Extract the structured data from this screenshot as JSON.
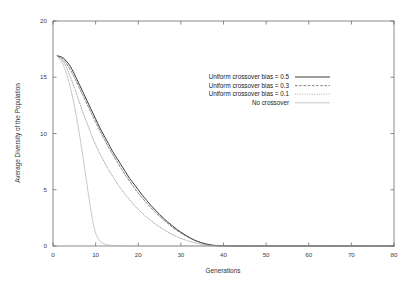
{
  "chart_data": {
    "type": "line",
    "title": "",
    "xlabel": "Generations",
    "ylabel": "Average Diversity of the Population",
    "xlim": [
      0,
      80
    ],
    "ylim": [
      0,
      20
    ],
    "xticks": [
      0,
      10,
      20,
      30,
      40,
      50,
      60,
      70,
      80
    ],
    "yticks": [
      0,
      5,
      10,
      15,
      20
    ],
    "grid": false,
    "legend_position": "upper-center-right",
    "series": [
      {
        "name": "Uniform crossover bias = 0.5",
        "style": "solid",
        "color": "#303030",
        "x": [
          1,
          2,
          3,
          4,
          5,
          6,
          7,
          8,
          9,
          10,
          11,
          12,
          13,
          14,
          15,
          16,
          17,
          18,
          19,
          20,
          21,
          22,
          23,
          24,
          25,
          26,
          27,
          28,
          29,
          30,
          31,
          32,
          33,
          34,
          35,
          36,
          37,
          38,
          40,
          45,
          50,
          60,
          70,
          80
        ],
        "y": [
          16.9,
          16.8,
          16.5,
          16.0,
          15.3,
          14.5,
          13.7,
          12.9,
          12.1,
          11.3,
          10.5,
          9.8,
          9.1,
          8.4,
          7.8,
          7.2,
          6.6,
          6.0,
          5.5,
          5.0,
          4.5,
          4.05,
          3.6,
          3.2,
          2.8,
          2.45,
          2.1,
          1.8,
          1.5,
          1.22,
          0.98,
          0.76,
          0.56,
          0.4,
          0.27,
          0.17,
          0.1,
          0.05,
          0.01,
          0.0,
          0.0,
          0.0,
          0.0,
          0.0
        ]
      },
      {
        "name": "Uniform crossover bias = 0.3",
        "style": "dashed",
        "color": "#5c5c5c",
        "x": [
          1,
          2,
          3,
          4,
          5,
          6,
          7,
          8,
          9,
          10,
          11,
          12,
          13,
          14,
          15,
          16,
          17,
          18,
          19,
          20,
          21,
          22,
          23,
          24,
          25,
          26,
          27,
          28,
          29,
          30,
          31,
          32,
          33,
          34,
          35,
          36,
          37,
          38,
          40,
          45,
          50,
          60,
          70,
          80
        ],
        "y": [
          16.9,
          16.7,
          16.3,
          15.7,
          15.0,
          14.2,
          13.4,
          12.6,
          11.8,
          11.0,
          10.25,
          9.5,
          8.8,
          8.15,
          7.5,
          6.9,
          6.3,
          5.75,
          5.2,
          4.7,
          4.25,
          3.8,
          3.4,
          3.0,
          2.65,
          2.3,
          1.98,
          1.68,
          1.4,
          1.15,
          0.92,
          0.72,
          0.54,
          0.38,
          0.26,
          0.16,
          0.09,
          0.04,
          0.01,
          0.0,
          0.0,
          0.0,
          0.0,
          0.0
        ]
      },
      {
        "name": "Uniform crossover bias = 0.1",
        "style": "dotted",
        "color": "#8a8a8a",
        "x": [
          1,
          2,
          3,
          4,
          5,
          6,
          7,
          8,
          9,
          10,
          11,
          12,
          13,
          14,
          15,
          16,
          17,
          18,
          19,
          20,
          21,
          22,
          23,
          24,
          25,
          26,
          27,
          28,
          29,
          30,
          31,
          32,
          33,
          34,
          35,
          36,
          38,
          40,
          45,
          50,
          60,
          70,
          80
        ],
        "y": [
          16.9,
          16.6,
          16.0,
          15.1,
          14.1,
          13.0,
          11.9,
          10.9,
          9.9,
          9.0,
          8.2,
          7.5,
          6.8,
          6.2,
          5.6,
          5.05,
          4.55,
          4.1,
          3.65,
          3.25,
          2.9,
          2.55,
          2.25,
          1.95,
          1.7,
          1.45,
          1.22,
          1.02,
          0.84,
          0.68,
          0.54,
          0.42,
          0.31,
          0.22,
          0.14,
          0.08,
          0.02,
          0.0,
          0.0,
          0.0,
          0.0,
          0.0,
          0.0
        ]
      },
      {
        "name": "No crossover",
        "style": "solid-light",
        "color": "#b0b0b0",
        "x": [
          1,
          2,
          3,
          4,
          5,
          6,
          7,
          8,
          9,
          9.5,
          10,
          10.5,
          11,
          11.5,
          12,
          13,
          15,
          20,
          30,
          40,
          60,
          80
        ],
        "y": [
          16.9,
          16.4,
          15.5,
          14.2,
          12.5,
          10.4,
          8.0,
          5.4,
          2.9,
          1.9,
          1.15,
          0.72,
          0.45,
          0.3,
          0.2,
          0.1,
          0.04,
          0.0,
          0.0,
          0.0,
          0.0,
          0.0
        ]
      }
    ]
  },
  "legend": {
    "entries": [
      {
        "label": "Uniform crossover bias = 0.5"
      },
      {
        "label": "Uniform crossover bias = 0.3"
      },
      {
        "label": "Uniform crossover bias = 0.1"
      },
      {
        "label": "No crossover"
      }
    ]
  },
  "axes": {
    "x_title": "Generations",
    "y_title": "Average Diversity of the Population",
    "x_tick_labels": [
      "0",
      "10",
      "20",
      "30",
      "40",
      "50",
      "60",
      "70",
      "80"
    ],
    "y_tick_labels": [
      "0",
      "5",
      "10",
      "15",
      "20"
    ]
  },
  "colors": {
    "background": "#ffffff",
    "frame": "#5a5a5a",
    "series_05": "#303030",
    "series_03": "#5c5c5c",
    "series_01": "#8a8a8a",
    "series_none": "#b0b0b0"
  }
}
